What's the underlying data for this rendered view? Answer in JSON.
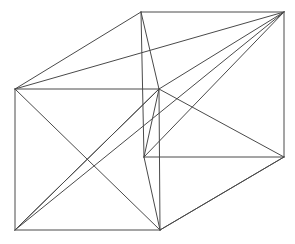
{
  "figure": {
    "kind": "line-drawing",
    "canvas": {
      "width": 295,
      "height": 244
    },
    "background_color": "#ffffff",
    "line_color": "#4a4a4a",
    "line_width": 1
  },
  "chart_data": {
    "type": "line",
    "xlabel": "",
    "ylabel": "",
    "xlim": [
      0,
      295
    ],
    "ylim": [
      0,
      244
    ],
    "grid": false,
    "legend": "none",
    "projection": "oblique",
    "vertices": [
      {
        "id": "front-top-left",
        "label": "A",
        "x": 15,
        "y": 89
      },
      {
        "id": "front-top-right",
        "label": "B",
        "x": 159,
        "y": 89
      },
      {
        "id": "front-bottom-right",
        "label": "C",
        "x": 160,
        "y": 230
      },
      {
        "id": "front-bottom-left",
        "label": "D",
        "x": 15,
        "y": 230
      },
      {
        "id": "back-top-left",
        "label": "E",
        "x": 141,
        "y": 12
      },
      {
        "id": "back-top-right",
        "label": "F",
        "x": 284,
        "y": 12
      },
      {
        "id": "back-bottom-right",
        "label": "G",
        "x": 284,
        "y": 157
      },
      {
        "id": "back-bottom-left",
        "label": "H",
        "x": 144,
        "y": 157
      }
    ],
    "edges": [
      {
        "id": "front-top",
        "kind": "box-edge",
        "from": "front-top-left",
        "to": "front-top-right"
      },
      {
        "id": "front-right",
        "kind": "box-edge",
        "from": "front-top-right",
        "to": "front-bottom-right"
      },
      {
        "id": "front-bottom",
        "kind": "box-edge",
        "from": "front-bottom-right",
        "to": "front-bottom-left"
      },
      {
        "id": "front-left",
        "kind": "box-edge",
        "from": "front-bottom-left",
        "to": "front-top-left"
      },
      {
        "id": "back-top",
        "kind": "box-edge",
        "from": "back-top-left",
        "to": "back-top-right"
      },
      {
        "id": "back-right",
        "kind": "box-edge",
        "from": "back-top-right",
        "to": "back-bottom-right"
      },
      {
        "id": "back-bottom",
        "kind": "box-edge",
        "from": "back-bottom-right",
        "to": "back-bottom-left"
      },
      {
        "id": "back-left",
        "kind": "box-edge",
        "from": "back-bottom-left",
        "to": "back-top-left"
      },
      {
        "id": "connect-top-left",
        "kind": "box-edge",
        "from": "front-top-left",
        "to": "back-top-left"
      },
      {
        "id": "connect-top-right",
        "kind": "box-edge",
        "from": "front-top-right",
        "to": "back-top-right"
      },
      {
        "id": "connect-bottom-right",
        "kind": "box-edge",
        "from": "front-bottom-right",
        "to": "back-bottom-right"
      },
      {
        "id": "top-face-diagonal",
        "kind": "face-diagonal",
        "from": "front-top-left",
        "to": "back-top-right"
      },
      {
        "id": "right-face-diagonal",
        "kind": "face-diagonal",
        "from": "front-top-right",
        "to": "back-bottom-right"
      },
      {
        "id": "back-face-diagonal",
        "kind": "face-diagonal",
        "from": "back-top-right",
        "to": "back-bottom-left"
      },
      {
        "id": "front-diagonal-tl-br",
        "kind": "face-diagonal",
        "from": "front-top-left",
        "to": "front-bottom-right"
      },
      {
        "id": "front-diagonal-bl-tr",
        "kind": "face-diagonal",
        "from": "front-bottom-left",
        "to": "front-top-right"
      },
      {
        "id": "lower-face-diagonal",
        "kind": "face-diagonal",
        "from": "front-bottom-right",
        "to": "back-bottom-right"
      },
      {
        "id": "mid-connect",
        "kind": "face-diagonal",
        "from": "front-top-right",
        "to": "back-bottom-left"
      },
      {
        "id": "lower-left-diagonal",
        "kind": "face-diagonal",
        "from": "back-bottom-left",
        "to": "front-bottom-right"
      },
      {
        "id": "body-diagonal-main",
        "kind": "body-diagonal",
        "from": "front-bottom-left",
        "to": "back-top-right"
      },
      {
        "id": "body-diagonal-second",
        "kind": "body-diagonal",
        "from": "front-bottom-left",
        "to": "front-top-right"
      },
      {
        "id": "back-left-to-hub",
        "kind": "body-diagonal",
        "from": "back-top-left",
        "to": "front-top-right"
      }
    ]
  }
}
